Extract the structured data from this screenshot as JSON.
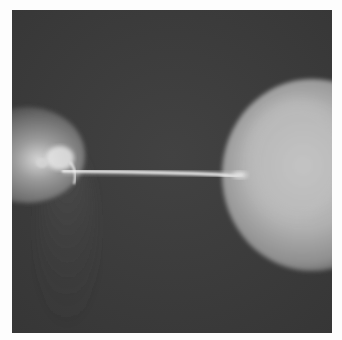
{
  "image": {
    "description": "Grayscale photograph of an electric spark discharging between a small sphere on the left and a larger sphere on the right",
    "colors": {
      "background": "#3a3a3a",
      "left_sphere": "#8a8a8a",
      "right_sphere": "#b4b4b4",
      "spark": "#f2f2f2",
      "frame": "#fdfdfd"
    }
  }
}
